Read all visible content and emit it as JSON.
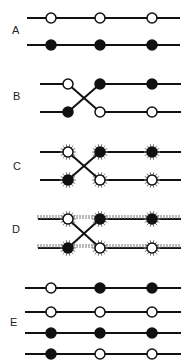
{
  "panels": [
    {
      "label": "A",
      "rows": [
        [
          "open",
          "open",
          "open"
        ],
        [
          "filled",
          "filled",
          "filled"
        ]
      ],
      "crossed": false,
      "hatched": false
    },
    {
      "label": "B",
      "rows": [
        [
          "open",
          "filled",
          "filled"
        ],
        [
          "filled",
          "open",
          "open"
        ]
      ],
      "crossed": true,
      "hatched": false
    },
    {
      "label": "C",
      "rows": [
        [
          "open",
          "filled",
          "filled"
        ],
        [
          "filled",
          "open",
          "open"
        ]
      ],
      "crossed": true,
      "hatched": "nodes"
    },
    {
      "label": "D",
      "rows": [
        [
          "open",
          "filled",
          "filled"
        ],
        [
          "filled",
          "open",
          "open"
        ]
      ],
      "crossed": true,
      "hatched": "nodes-and-lines"
    },
    {
      "label": "E",
      "rows": [
        [
          "open",
          "filled",
          "filled"
        ],
        [
          "open",
          "open",
          "open"
        ],
        [
          "filled",
          "filled",
          "filled"
        ],
        [
          "filled",
          "open",
          "open"
        ]
      ],
      "crossed": false,
      "hatched": false
    }
  ],
  "colors": {
    "line": "#111111",
    "filled": "#111111",
    "open": "#ffffff",
    "hatch": "#777777"
  }
}
